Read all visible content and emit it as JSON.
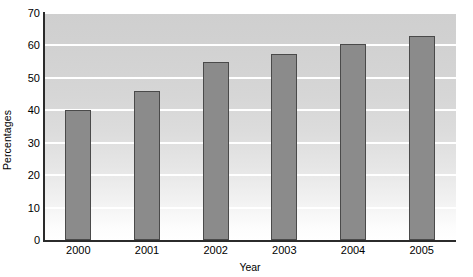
{
  "chart_data": {
    "type": "bar",
    "title": "",
    "subtitle": "",
    "xlabel": "Year",
    "ylabel": "Percentages",
    "categories": [
      "2000",
      "2001",
      "2002",
      "2003",
      "2004",
      "2005"
    ],
    "values": [
      40,
      46,
      55,
      57.5,
      60.5,
      63
    ],
    "ylim": [
      0,
      70
    ],
    "ytick_labels": [
      "0",
      "10",
      "20",
      "30",
      "40",
      "50",
      "60",
      "70"
    ],
    "ytick_values": [
      0,
      10,
      20,
      30,
      40,
      50,
      60,
      70
    ],
    "grid": "horizontal-white-gridlines",
    "legend": "none",
    "legend_position": "none",
    "series": [
      {
        "name": "Percentages",
        "values": [
          40,
          46,
          55,
          57.5,
          60.5,
          63
        ]
      }
    ],
    "colors": {
      "bar_fill": "#8b8b8b",
      "bar_border": "#4a4a4a",
      "plot_background_top": "#cfcfcf",
      "plot_background_bottom": "#ffffff",
      "gridline": "#ffffff",
      "axis_line": "#2b2b2b",
      "text": "#000000"
    },
    "annotations": []
  }
}
